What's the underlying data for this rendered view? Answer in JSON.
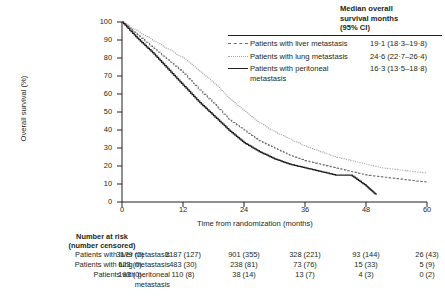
{
  "chart_data": {
    "type": "line",
    "title": "",
    "xlabel": "Time from randomization (months)",
    "ylabel": "Overall survival (%)",
    "xlim": [
      0,
      60
    ],
    "ylim": [
      0,
      100
    ],
    "xticks": [
      "0",
      "12",
      "24",
      "36",
      "48",
      "60"
    ],
    "yticks": [
      "0",
      "10",
      "20",
      "30",
      "40",
      "50",
      "60",
      "70",
      "80",
      "90",
      "100"
    ],
    "grid": false,
    "legend_position": "top-right",
    "series": [
      {
        "name": "Patients with liver metastasis",
        "style": "dashed",
        "color": "#6d6e71",
        "x": [
          0,
          3,
          6,
          9,
          12,
          15,
          18,
          21,
          24,
          27,
          30,
          33,
          36,
          39,
          42,
          45,
          48,
          51,
          54,
          57,
          60
        ],
        "y": [
          100,
          93,
          86,
          79,
          72,
          63,
          55,
          46,
          40,
          34,
          30,
          26,
          23,
          21,
          19,
          17,
          15,
          14,
          13,
          12,
          11
        ]
      },
      {
        "name": "Patients with lung metastasis",
        "style": "dotted",
        "color": "#a7a9ac",
        "x": [
          0,
          3,
          6,
          9,
          12,
          15,
          18,
          21,
          24,
          27,
          30,
          33,
          36,
          39,
          42,
          45,
          48,
          51,
          54,
          57,
          60
        ],
        "y": [
          100,
          95,
          90,
          85,
          80,
          73,
          66,
          58,
          51,
          44,
          39,
          35,
          31,
          28,
          25,
          23,
          21,
          19,
          18,
          17,
          16
        ]
      },
      {
        "name": "Patients with peritoneal metastasis",
        "style": "solid",
        "color": "#231f20",
        "x": [
          0,
          3,
          6,
          9,
          12,
          15,
          18,
          21,
          24,
          27,
          30,
          33,
          36,
          39,
          42,
          45,
          48,
          50
        ],
        "y": [
          100,
          91,
          83,
          74,
          65,
          56,
          48,
          40,
          33,
          28,
          24,
          21,
          19,
          17,
          15,
          15,
          9,
          4
        ]
      }
    ]
  },
  "median_table": {
    "header": [
      "Median overall",
      "survival months",
      "(95% CI)"
    ],
    "rows": [
      {
        "key": "liver",
        "label": "Patients with liver metastasis",
        "label_cont": "",
        "value": "19·1 (18·3–19·8)"
      },
      {
        "key": "lung",
        "label": "Patients with lung metastasis",
        "label_cont": "",
        "value": "24·6 (22·7–26·4)"
      },
      {
        "key": "peritoneal",
        "label": "Patients with peritoneal",
        "label_cont": "metastasis",
        "value": "16·3 (13·5–18·8)"
      }
    ]
  },
  "risk_table": {
    "title_line1": "Number at risk",
    "title_line2": "(number censored)",
    "rows": [
      {
        "label": "Patients with liver metastasis",
        "label_cont": "",
        "cells": [
          "3179 (2)",
          "2187 (127)",
          "901 (355)",
          "328 (221)",
          "93 (144)",
          "26 (43)"
        ]
      },
      {
        "label": "Patients with lung metastasis",
        "label_cont": "",
        "cells": [
          "623 (0)",
          "483 (30)",
          "238 (81)",
          "73 (76)",
          "15 (33)",
          "5 (9)"
        ]
      },
      {
        "label": "Patients with peritoneal",
        "label_cont": "metastasis",
        "cells": [
          "193 (0)",
          "110 (8)",
          "38 (14)",
          "13 (7)",
          "4 (3)",
          "0 (2)"
        ]
      }
    ]
  }
}
